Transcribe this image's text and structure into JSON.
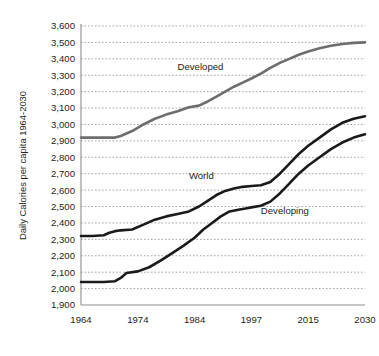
{
  "chart_data": {
    "type": "line",
    "title": "",
    "xlabel": "",
    "ylabel": "Daily Calories per capita 1964-2030",
    "xlim": [
      1964,
      2030
    ],
    "ylim": [
      1900,
      3600
    ],
    "grid": true,
    "legend_position": "inline-annotations",
    "x_ticks": [
      "1964",
      "1974",
      "1984",
      "1997",
      "2015",
      "2030"
    ],
    "x_tick_values": [
      1964,
      1974,
      1984,
      1997,
      2015,
      2030
    ],
    "y_ticks": [
      "1,900",
      "2,000",
      "2,100",
      "2,200",
      "2,300",
      "2,400",
      "2,500",
      "2,600",
      "2,700",
      "2,800",
      "2,900",
      "3,000",
      "3,100",
      "3,200",
      "3,300",
      "3,400",
      "3,500",
      "3,600"
    ],
    "y_tick_values": [
      1900,
      2000,
      2100,
      2200,
      2300,
      2400,
      2500,
      2600,
      2700,
      2800,
      2900,
      3000,
      3100,
      3200,
      3300,
      3400,
      3500,
      3600
    ],
    "series": [
      {
        "name": "Developed",
        "color": "#6d6d6d",
        "width": 2.6,
        "label_x": 1981,
        "label_y": 3330,
        "x": [
          1964,
          1966,
          1968,
          1970,
          1971,
          1973,
          1975,
          1977,
          1979,
          1981,
          1983,
          1985,
          1987,
          1989,
          1991,
          1993,
          1995,
          1997,
          2000,
          2003,
          2006,
          2009,
          2012,
          2015,
          2018,
          2021,
          2024,
          2027,
          2030
        ],
        "y": [
          2920,
          2920,
          2920,
          2920,
          2930,
          2960,
          3000,
          3035,
          3060,
          3080,
          3105,
          3115,
          3140,
          3170,
          3200,
          3230,
          3255,
          3280,
          3310,
          3345,
          3375,
          3400,
          3425,
          3445,
          3465,
          3480,
          3490,
          3497,
          3500
        ]
      },
      {
        "name": "World",
        "color": "#1a1a1a",
        "width": 2.6,
        "label_x": 1983,
        "label_y": 2665,
        "x": [
          1964,
          1966,
          1968,
          1969,
          1970,
          1971,
          1973,
          1975,
          1977,
          1979,
          1981,
          1983,
          1985,
          1987,
          1989,
          1991,
          1993,
          1995,
          1997,
          2000,
          2003,
          2006,
          2009,
          2012,
          2015,
          2018,
          2021,
          2024,
          2027,
          2030
        ],
        "y": [
          2320,
          2320,
          2325,
          2340,
          2350,
          2355,
          2360,
          2390,
          2420,
          2440,
          2455,
          2470,
          2500,
          2535,
          2570,
          2595,
          2610,
          2620,
          2625,
          2630,
          2650,
          2700,
          2760,
          2820,
          2870,
          2920,
          2970,
          3010,
          3035,
          3050
        ]
      },
      {
        "name": "Developing",
        "color": "#1a1a1a",
        "width": 2.6,
        "label_x": 2000,
        "label_y": 2455,
        "x": [
          1964,
          1966,
          1968,
          1970,
          1971,
          1972,
          1974,
          1976,
          1978,
          1980,
          1982,
          1984,
          1986,
          1988,
          1990,
          1992,
          1994,
          1996,
          1997,
          2000,
          2003,
          2006,
          2009,
          2012,
          2015,
          2018,
          2021,
          2024,
          2027,
          2030
        ],
        "y": [
          2040,
          2040,
          2040,
          2045,
          2065,
          2095,
          2105,
          2130,
          2170,
          2215,
          2260,
          2310,
          2360,
          2400,
          2440,
          2470,
          2480,
          2490,
          2495,
          2505,
          2530,
          2580,
          2640,
          2700,
          2750,
          2800,
          2850,
          2890,
          2920,
          2940
        ]
      }
    ]
  }
}
